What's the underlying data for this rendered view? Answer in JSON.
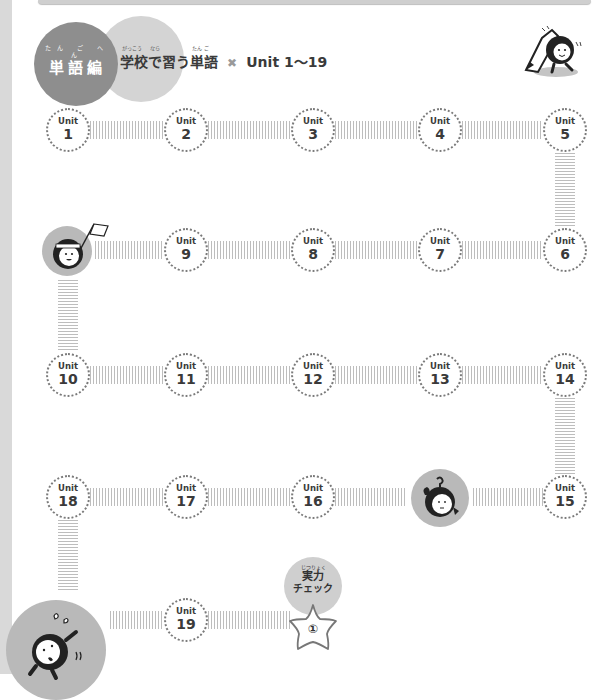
{
  "header": {
    "category_ruby": "たん ご へん",
    "category": "単語編",
    "title_ruby": [
      "がっこう",
      "なら",
      "たん ご"
    ],
    "title": "学校で習う単語",
    "separator": "✖",
    "range": "Unit 1～19"
  },
  "units": [
    {
      "label": "Unit",
      "number": "1"
    },
    {
      "label": "Unit",
      "number": "2"
    },
    {
      "label": "Unit",
      "number": "3"
    },
    {
      "label": "Unit",
      "number": "4"
    },
    {
      "label": "Unit",
      "number": "5"
    },
    {
      "label": "Unit",
      "number": "6"
    },
    {
      "label": "Unit",
      "number": "7"
    },
    {
      "label": "Unit",
      "number": "8"
    },
    {
      "label": "Unit",
      "number": "9"
    },
    {
      "label": "Unit",
      "number": "10"
    },
    {
      "label": "Unit",
      "number": "11"
    },
    {
      "label": "Unit",
      "number": "12"
    },
    {
      "label": "Unit",
      "number": "13"
    },
    {
      "label": "Unit",
      "number": "14"
    },
    {
      "label": "Unit",
      "number": "15"
    },
    {
      "label": "Unit",
      "number": "16"
    },
    {
      "label": "Unit",
      "number": "17"
    },
    {
      "label": "Unit",
      "number": "18"
    },
    {
      "label": "Unit",
      "number": "19"
    }
  ],
  "check": {
    "ruby": "じつりょく",
    "line1": "実力",
    "line2": "チェック",
    "star_number": "①"
  },
  "colors": {
    "dark_circle": "#8e8e8e",
    "light_circle": "#d4d4d4",
    "mascot_bg": "#b9b9b9",
    "dotted_border": "#7a7a7a"
  },
  "icons": {
    "pencil_mascot": "pencil-mascot-icon",
    "flag_mascot": "flag-mascot-icon",
    "worried_mascot": "worried-mascot-icon",
    "running_mascot": "running-mascot-icon",
    "star": "star-icon"
  }
}
